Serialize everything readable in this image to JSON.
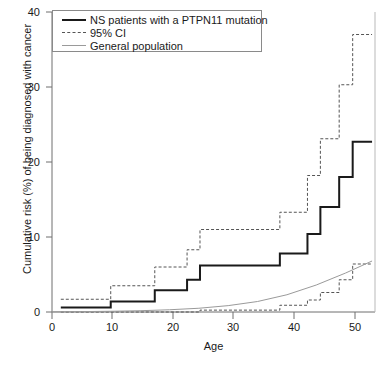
{
  "chart_data": {
    "type": "line",
    "title": "",
    "xlabel": "Age",
    "ylabel": "Cumulative risk (%) of being diagnosed with cancer",
    "xlim": [
      0,
      55
    ],
    "ylim": [
      0,
      40
    ],
    "xticks": [
      0,
      10,
      20,
      30,
      40,
      50
    ],
    "yticks": [
      0,
      10,
      20,
      30,
      40
    ],
    "grid": false,
    "legend_position": "top-left",
    "legend": [
      {
        "label": "NS patients with a PTPN11 mutation",
        "style": "solid",
        "color": "#1a1a1a"
      },
      {
        "label": "95% CI",
        "style": "dotted",
        "color": "#555555"
      },
      {
        "label": "General population",
        "style": "thin-solid",
        "color": "#9a9a9a"
      }
    ],
    "series": [
      {
        "name": "NS patients with a PTPN11 mutation",
        "style": "step",
        "points": [
          {
            "x": 1.5,
            "y": 0.6
          },
          {
            "x": 10.0,
            "y": 0.6
          },
          {
            "x": 10.0,
            "y": 1.4
          },
          {
            "x": 17.5,
            "y": 1.4
          },
          {
            "x": 17.5,
            "y": 2.9
          },
          {
            "x": 23.0,
            "y": 2.9
          },
          {
            "x": 23.0,
            "y": 4.3
          },
          {
            "x": 25.2,
            "y": 4.3
          },
          {
            "x": 25.2,
            "y": 6.2
          },
          {
            "x": 38.8,
            "y": 6.2
          },
          {
            "x": 38.8,
            "y": 7.8
          },
          {
            "x": 43.5,
            "y": 7.8
          },
          {
            "x": 43.5,
            "y": 10.4
          },
          {
            "x": 45.7,
            "y": 10.4
          },
          {
            "x": 45.7,
            "y": 14.0
          },
          {
            "x": 48.9,
            "y": 14.0
          },
          {
            "x": 48.9,
            "y": 18.0
          },
          {
            "x": 51.2,
            "y": 18.0
          },
          {
            "x": 51.2,
            "y": 22.7
          },
          {
            "x": 54.5,
            "y": 22.7
          }
        ]
      },
      {
        "name": "95% CI upper",
        "style": "step-dotted",
        "points": [
          {
            "x": 1.5,
            "y": 1.7
          },
          {
            "x": 10.0,
            "y": 1.7
          },
          {
            "x": 10.0,
            "y": 3.5
          },
          {
            "x": 17.5,
            "y": 3.5
          },
          {
            "x": 17.5,
            "y": 6.0
          },
          {
            "x": 23.0,
            "y": 6.0
          },
          {
            "x": 23.0,
            "y": 8.3
          },
          {
            "x": 25.2,
            "y": 8.3
          },
          {
            "x": 25.2,
            "y": 11.0
          },
          {
            "x": 38.8,
            "y": 11.0
          },
          {
            "x": 38.8,
            "y": 13.3
          },
          {
            "x": 43.5,
            "y": 13.3
          },
          {
            "x": 43.5,
            "y": 18.2
          },
          {
            "x": 45.7,
            "y": 18.2
          },
          {
            "x": 45.7,
            "y": 23.1
          },
          {
            "x": 48.9,
            "y": 23.1
          },
          {
            "x": 48.9,
            "y": 30.3
          },
          {
            "x": 51.2,
            "y": 30.3
          },
          {
            "x": 51.2,
            "y": 37.0
          },
          {
            "x": 54.5,
            "y": 37.0
          }
        ]
      },
      {
        "name": "95% CI lower",
        "style": "step-dotted",
        "points": [
          {
            "x": 1.5,
            "y": 0.0
          },
          {
            "x": 25.2,
            "y": 0.0
          },
          {
            "x": 25.2,
            "y": 0.25
          },
          {
            "x": 38.8,
            "y": 0.25
          },
          {
            "x": 38.8,
            "y": 0.9
          },
          {
            "x": 43.5,
            "y": 0.9
          },
          {
            "x": 43.5,
            "y": 1.6
          },
          {
            "x": 45.7,
            "y": 1.6
          },
          {
            "x": 45.7,
            "y": 2.6
          },
          {
            "x": 48.9,
            "y": 2.6
          },
          {
            "x": 48.9,
            "y": 4.3
          },
          {
            "x": 51.2,
            "y": 4.3
          },
          {
            "x": 51.2,
            "y": 6.4
          },
          {
            "x": 54.5,
            "y": 6.4
          }
        ]
      },
      {
        "name": "General population",
        "style": "smooth",
        "points": [
          {
            "x": 0,
            "y": 0.02
          },
          {
            "x": 5,
            "y": 0.05
          },
          {
            "x": 10,
            "y": 0.1
          },
          {
            "x": 15,
            "y": 0.17
          },
          {
            "x": 20,
            "y": 0.3
          },
          {
            "x": 25,
            "y": 0.5
          },
          {
            "x": 30,
            "y": 0.85
          },
          {
            "x": 35,
            "y": 1.4
          },
          {
            "x": 40,
            "y": 2.3
          },
          {
            "x": 45,
            "y": 3.6
          },
          {
            "x": 50,
            "y": 5.2
          },
          {
            "x": 54.5,
            "y": 6.8
          }
        ]
      }
    ]
  },
  "axes": {
    "xlabel": "Age",
    "ylabel": "Cumulative risk (%) of being diagnosed with cancer",
    "xtick_labels": [
      "0",
      "10",
      "20",
      "30",
      "40",
      "50"
    ],
    "ytick_labels": [
      "0",
      "10",
      "20",
      "30",
      "40"
    ]
  },
  "legend": {
    "items": [
      {
        "label": "NS patients with a PTPN11 mutation"
      },
      {
        "label": "95% CI"
      },
      {
        "label": "General population"
      }
    ]
  },
  "colors": {
    "solid_line": "#1a1a1a",
    "ci_line": "#555555",
    "population_line": "#9a9a9a",
    "axis": "#6f6f6f",
    "background": "#ffffff"
  }
}
